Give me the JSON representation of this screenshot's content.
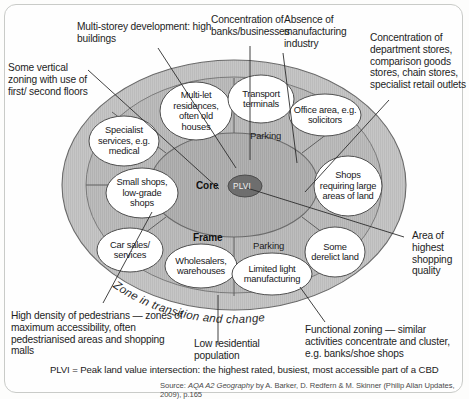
{
  "diagram": {
    "colors": {
      "outer_zone_fill": "#c3c3c3",
      "inner_zone_fill": "#b4b4b4",
      "core_fill": "#a8a8a8",
      "plvi_fill": "#6e6e6e",
      "bubble_fill": "#ffffff",
      "stroke": "#5a5a5a",
      "text": "#1d1d1d",
      "card_border": "#c9cbc8"
    },
    "zone_labels": [
      {
        "name": "core",
        "text": "Core"
      },
      {
        "name": "frame",
        "text": "Frame"
      },
      {
        "name": "zone-in-transition",
        "text": "Zone in transition and change"
      }
    ],
    "plvi_label": "PLVI",
    "parking_labels": [
      "Parking",
      "Parking"
    ],
    "bubbles": [
      {
        "id": "multi-let-residences",
        "text": "Multi-let residences, often old houses"
      },
      {
        "id": "transport-terminals",
        "text": "Transport terminals"
      },
      {
        "id": "office-area",
        "text": "Office area, e.g. solicitors"
      },
      {
        "id": "specialist-services",
        "text": "Specialist services, e.g. medical"
      },
      {
        "id": "small-shops",
        "text": "Small shops, low-grade shops"
      },
      {
        "id": "car-sales",
        "text": "Car sales/ services"
      },
      {
        "id": "wholesalers",
        "text": "Wholesalers, warehouses"
      },
      {
        "id": "limited-light-manufacturing",
        "text": "Limited light manufacturing"
      },
      {
        "id": "some-derelict-land",
        "text": "Some derelict land"
      },
      {
        "id": "shops-large-areas",
        "text": "Shops requiring large areas of land"
      }
    ],
    "annotations": [
      {
        "id": "multi-storey-development",
        "text": "Multi-storey development: high buildings"
      },
      {
        "id": "some-vertical-zoning",
        "text": "Some vertical zoning with use of first/ second floors"
      },
      {
        "id": "concentration-banks",
        "text": "Concentration of banks/businesses"
      },
      {
        "id": "absence-manufacturing",
        "text": "Absence of manufacturing industry"
      },
      {
        "id": "concentration-department-stores",
        "text": "Concentration of department stores, comparison goods stores, chain stores, specialist retail outlets"
      },
      {
        "id": "area-highest-shopping-quality",
        "text": "Area of highest shopping quality"
      },
      {
        "id": "high-density-pedestrians",
        "text": "High density of pedestrians — zones of maximum accessibility, often pedestrianised areas and shopping malls"
      },
      {
        "id": "low-residential-population",
        "text": "Low residential population"
      },
      {
        "id": "functional-zoning",
        "text": "Functional zoning — similar activities concentrate and cluster, e.g. banks/shoe shops"
      }
    ],
    "footnote": "PLVI = Peak land value intersection: the highest rated, busiest, most accessible part of a CBD",
    "source": {
      "prefix": "Source: ",
      "title": "AQA A2 Geography",
      "rest": " by A. Barker, D. Redfern & M. Skinner (Philip Allan Updates, 2009), p.165"
    }
  }
}
